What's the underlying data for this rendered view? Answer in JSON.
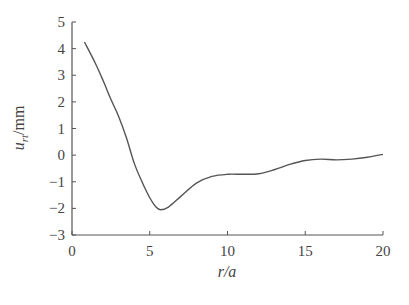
{
  "chart_data": {
    "type": "line",
    "title": "",
    "xlabel": "r/a",
    "ylabel": "u_rt/mm",
    "ylabel_parts": {
      "main": "u",
      "sub": "rt",
      "unit": "/mm"
    },
    "xlim": [
      0,
      20
    ],
    "ylim": [
      -3,
      5
    ],
    "xticks": [
      0,
      5,
      10,
      15,
      20
    ],
    "yticks": [
      5,
      4,
      3,
      2,
      1,
      0,
      -1,
      -2,
      -3
    ],
    "grid": false,
    "legend": null,
    "series": [
      {
        "name": "u_rt",
        "x": [
          0.8,
          1.5,
          2.0,
          2.5,
          3.0,
          3.5,
          4.0,
          4.5,
          5.0,
          5.4,
          5.7,
          6.2,
          7.0,
          8.0,
          9.0,
          10.0,
          11.0,
          12.0,
          13.0,
          14.0,
          15.0,
          16.0,
          17.0,
          18.0,
          19.0,
          20.0
        ],
        "y": [
          4.25,
          3.45,
          2.8,
          2.1,
          1.45,
          0.65,
          -0.3,
          -1.0,
          -1.6,
          -1.95,
          -2.05,
          -1.95,
          -1.55,
          -1.05,
          -0.8,
          -0.72,
          -0.72,
          -0.7,
          -0.55,
          -0.35,
          -0.2,
          -0.15,
          -0.18,
          -0.15,
          -0.08,
          0.03
        ]
      }
    ]
  }
}
